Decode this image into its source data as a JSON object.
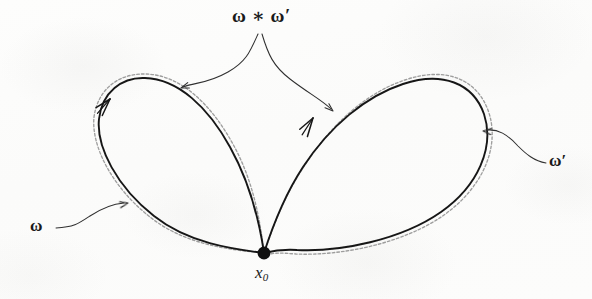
{
  "figure": {
    "background_color": "#fcfcfb",
    "ink_color": "#1a1a1a",
    "dashed_guide_color": "#8d8d8d",
    "labels": {
      "product": "ω ∗ ω′",
      "left_loop": "ω",
      "right_loop": "ω′",
      "basepoint_symbol": "x",
      "basepoint_subscript": "0"
    },
    "basepoint": {
      "x": 264,
      "y": 253,
      "radius": 6.5
    },
    "left_loop": {
      "name": "omega",
      "direction": "counterclockwise",
      "arrow_at": {
        "x": 108,
        "y": 100
      },
      "path": "M 264 253 C 232 249 188 243 154 216 C 117 187 96 147 99 119 C 102 92 122 77 145 78 C 178 79 208 107 230 147 C 249 181 259 219 264 253 Z",
      "dashed_path": "M 264 253 C 231 250 185 245 150 217 C 112 187 91 146 94 117 C 98 88 120 73 146 74 C 181 75 212 105 234 146 C 253 181 260 219 264 253"
    },
    "right_loop": {
      "name": "omega-prime",
      "direction": "clockwise",
      "arrow_at": {
        "x": 310,
        "y": 122
      },
      "path": "M 264 253 C 272 228 284 196 303 167 C 330 126 366 96 403 84 C 442 71 473 83 484 114 C 495 147 478 186 441 212 C 401 240 340 252 297 250 C 283 249 272 251 264 253 Z",
      "dashed_path": "M 264 253 C 273 227 285 194 305 165 C 332 123 368 92 405 80 C 446 66 478 79 489 113 C 500 148 482 188 444 215 C 403 244 340 256 296 254 C 282 253 272 252 264 256"
    },
    "pointers": [
      {
        "name": "product-pointer-left",
        "path": "M 258 34 C 250 52 246 62 228 72 C 207 84 196 82 183 87",
        "arrow_at": {
          "x": 181,
          "y": 88
        },
        "arrow_angle": 160
      },
      {
        "name": "product-pointer-right",
        "path": "M 262 34 C 268 54 273 66 290 79 C 308 93 322 100 331 109",
        "arrow_at": {
          "x": 333,
          "y": 111
        },
        "arrow_angle": 42
      },
      {
        "name": "omega-pointer",
        "path": "M 56 228 C 74 227 78 224 90 216 C 102 208 112 204 124 203",
        "arrow_at": {
          "x": 127,
          "y": 203
        },
        "arrow_angle": 352
      },
      {
        "name": "omega-prime-pointer",
        "path": "M 546 163 C 534 161 526 154 518 146 C 507 134 498 129 487 130",
        "arrow_at": {
          "x": 483,
          "y": 131
        },
        "arrow_angle": 187
      }
    ]
  }
}
